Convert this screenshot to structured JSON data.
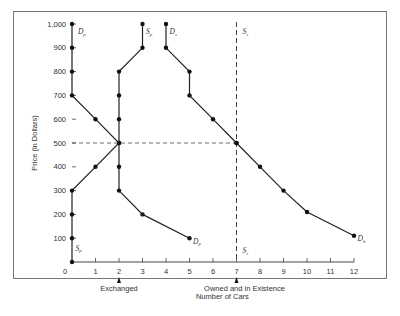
{
  "chart_data": {
    "type": "line",
    "title": "",
    "xlabel": "Number of Cars",
    "ylabel": "Price (in Dollars)",
    "xlim": [
      0,
      12
    ],
    "ylim": [
      0,
      1000
    ],
    "x_ticks": [
      0,
      1,
      2,
      3,
      4,
      5,
      6,
      7,
      8,
      9,
      10,
      11,
      12
    ],
    "y_ticks": [
      100,
      200,
      300,
      400,
      500,
      600,
      700,
      800,
      900,
      1000
    ],
    "y_tick_labels": [
      "100",
      "200",
      "300",
      "400",
      "500",
      "600",
      "700",
      "800",
      "900",
      "1,000"
    ],
    "x_annotations": [
      {
        "x": 2,
        "label": "Exchanged"
      },
      {
        "x": 7,
        "label": "Owned and in Existence"
      }
    ],
    "series": [
      {
        "name": "Dp",
        "label": "D",
        "sub": "p",
        "points": [
          [
            0,
            1000
          ],
          [
            0,
            900
          ],
          [
            0,
            800
          ],
          [
            0,
            700
          ],
          [
            1,
            600
          ],
          [
            2,
            500
          ],
          [
            3,
            400
          ],
          [
            4,
            300
          ],
          [
            5,
            200
          ],
          [
            5,
            100
          ]
        ]
      },
      {
        "name": "Sp",
        "label": "S",
        "sub": "p",
        "points": [
          [
            0,
            0
          ],
          [
            0,
            100
          ],
          [
            0,
            200
          ],
          [
            0,
            300
          ],
          [
            1,
            400
          ],
          [
            2,
            500
          ],
          [
            3,
            600
          ],
          [
            4,
            700
          ],
          [
            5,
            800
          ],
          [
            5,
            900
          ]
        ]
      },
      {
        "name": "Dp_curve",
        "points": [
          [
            0,
            1000
          ],
          [
            0,
            900
          ],
          [
            0,
            800
          ],
          [
            0,
            700
          ],
          [
            1,
            600
          ],
          [
            2,
            500
          ],
          [
            1,
            400
          ],
          [
            0,
            300
          ],
          [
            0,
            200
          ],
          [
            0,
            100
          ],
          [
            0,
            0
          ]
        ]
      },
      {
        "name": "Ss_exchange",
        "points": [
          [
            3,
            1000
          ],
          [
            3,
            900
          ],
          [
            2,
            800
          ],
          [
            2,
            700
          ],
          [
            2,
            600
          ],
          [
            2,
            500
          ],
          [
            2,
            400
          ],
          [
            2,
            300
          ],
          [
            3,
            200
          ],
          [
            5,
            100
          ]
        ]
      },
      {
        "name": "Ds",
        "label": "D",
        "sub": "s",
        "points": [
          [
            4,
            1000
          ],
          [
            4,
            900
          ],
          [
            5,
            800
          ],
          [
            5,
            700
          ],
          [
            6,
            600
          ],
          [
            7,
            500
          ],
          [
            8,
            400
          ],
          [
            9,
            300
          ],
          [
            10,
            210
          ],
          [
            12,
            110
          ]
        ]
      },
      {
        "name": "Ss",
        "label": "S",
        "sub": "s",
        "style": "dashed",
        "points": [
          [
            7,
            0
          ],
          [
            7,
            1000
          ]
        ]
      }
    ],
    "reference_lines": [
      {
        "type": "horizontal",
        "y": 500,
        "x_from": 0,
        "x_to": 7,
        "style": "dashed"
      },
      {
        "type": "vertical",
        "x": 7,
        "style": "dashed"
      }
    ],
    "curve_labels": [
      {
        "text": "D",
        "sub": "p",
        "x": 0.25,
        "y": 970
      },
      {
        "text": "S",
        "sub": "p",
        "x": 3.15,
        "y": 970
      },
      {
        "text": "D",
        "sub": "s",
        "x": 4.15,
        "y": 970
      },
      {
        "text": "S",
        "sub": "s",
        "x": 7.25,
        "y": 970
      },
      {
        "text": "S",
        "sub": "p",
        "x": 0.15,
        "y": 60
      },
      {
        "text": "D",
        "sub": "p",
        "x": 5.15,
        "y": 90
      },
      {
        "text": "S",
        "sub": "s",
        "x": 7.25,
        "y": 50
      },
      {
        "text": "D",
        "sub": "h",
        "x": 12.15,
        "y": 100
      }
    ],
    "grid": false,
    "legend": "none"
  },
  "labels": {
    "xlabel": "Number of Cars",
    "ylabel": "Price (in Dollars)",
    "exchanged": "Exchanged",
    "owned": "Owned and in Existence"
  }
}
